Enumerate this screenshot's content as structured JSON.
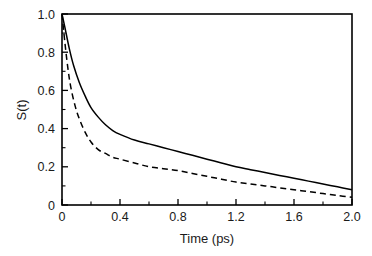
{
  "chart_data": {
    "type": "line",
    "title": "",
    "xlabel": "Time (ps)",
    "ylabel": "S(t)",
    "xlim": [
      0,
      2.0
    ],
    "ylim": [
      0,
      1.0
    ],
    "grid": false,
    "legend": "none",
    "x_ticks": [
      "0",
      "0.4",
      "0.8",
      "1.2",
      "1.6",
      "2.0"
    ],
    "x_tick_values": [
      0,
      0.4,
      0.8,
      1.2,
      1.6,
      2.0
    ],
    "x_minor_tick_values": [
      0.2,
      0.6,
      1.0,
      1.4,
      1.8
    ],
    "y_ticks": [
      "0",
      "0.2",
      "0.4",
      "0.6",
      "0.8",
      "1.0"
    ],
    "y_tick_values": [
      0,
      0.2,
      0.4,
      0.6,
      0.8,
      1.0
    ],
    "y_minor_tick_values": [
      0.1,
      0.3,
      0.5,
      0.7,
      0.9
    ],
    "series": [
      {
        "name": "solid-curve",
        "style": "solid",
        "color": "#000000",
        "x": [
          0.0,
          0.02,
          0.05,
          0.08,
          0.12,
          0.16,
          0.2,
          0.25,
          0.3,
          0.35,
          0.4,
          0.5,
          0.6,
          0.7,
          0.8,
          0.9,
          1.0,
          1.1,
          1.2,
          1.3,
          1.4,
          1.5,
          1.6,
          1.7,
          1.8,
          1.9,
          2.0
        ],
        "y": [
          1.0,
          0.93,
          0.82,
          0.73,
          0.64,
          0.57,
          0.51,
          0.46,
          0.42,
          0.39,
          0.37,
          0.34,
          0.32,
          0.3,
          0.28,
          0.26,
          0.24,
          0.22,
          0.2,
          0.185,
          0.17,
          0.155,
          0.14,
          0.125,
          0.11,
          0.095,
          0.08
        ]
      },
      {
        "name": "dashed-curve",
        "style": "dashed",
        "color": "#000000",
        "x": [
          0.0,
          0.02,
          0.04,
          0.06,
          0.09,
          0.12,
          0.16,
          0.2,
          0.25,
          0.3,
          0.35,
          0.4,
          0.5,
          0.6,
          0.7,
          0.8,
          0.9,
          1.0,
          1.1,
          1.2,
          1.3,
          1.4,
          1.5,
          1.6,
          1.7,
          1.8,
          1.9,
          2.0
        ],
        "y": [
          1.0,
          0.85,
          0.72,
          0.62,
          0.52,
          0.45,
          0.38,
          0.33,
          0.29,
          0.27,
          0.25,
          0.24,
          0.22,
          0.2,
          0.19,
          0.18,
          0.165,
          0.15,
          0.135,
          0.12,
          0.11,
          0.1,
          0.09,
          0.08,
          0.07,
          0.06,
          0.05,
          0.04
        ]
      }
    ]
  }
}
